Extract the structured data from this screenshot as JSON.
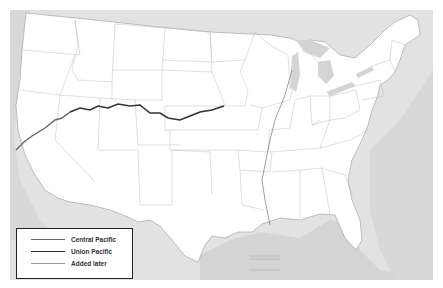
{
  "map": {
    "title": "United States transcontinental railroad map",
    "colors": {
      "land": "#ffffff",
      "water": "#d6d6d6",
      "foreign_land": "#e4e4e4",
      "state_border": "#b9b9b9",
      "central_pacific": "#666666",
      "union_pacific": "#333333",
      "added_later": "#9a9a9a"
    }
  },
  "legend": {
    "items": [
      {
        "label": "Central Pacific",
        "color": "#666666",
        "width": 1.4
      },
      {
        "label": "Union Pacific",
        "color": "#333333",
        "width": 1.6
      },
      {
        "label": "Added later",
        "color": "#9a9a9a",
        "width": 0.8
      }
    ]
  },
  "scale_box": {
    "label": "Scale"
  }
}
